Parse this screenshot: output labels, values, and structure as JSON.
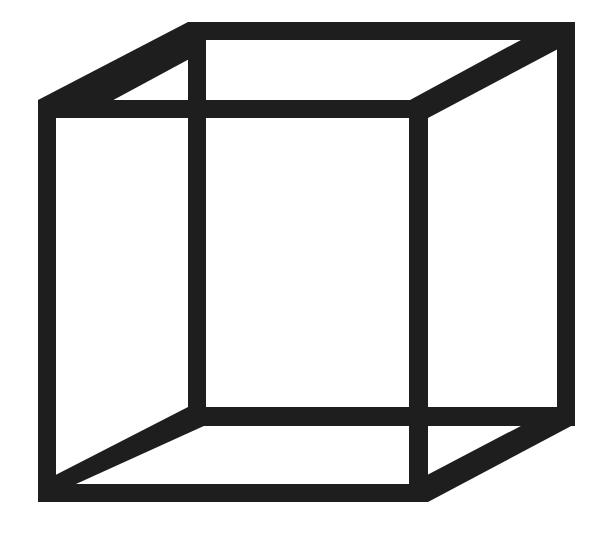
{
  "figure": {
    "colors": {
      "edge": "#1e1e1e",
      "background": "#ffffff"
    },
    "edge_thickness": 18,
    "front_square": {
      "x": 38,
      "y": 100,
      "width": 390,
      "height": 402
    },
    "back_square": {
      "x": 188,
      "y": 22,
      "width": 387,
      "height": 404
    }
  }
}
